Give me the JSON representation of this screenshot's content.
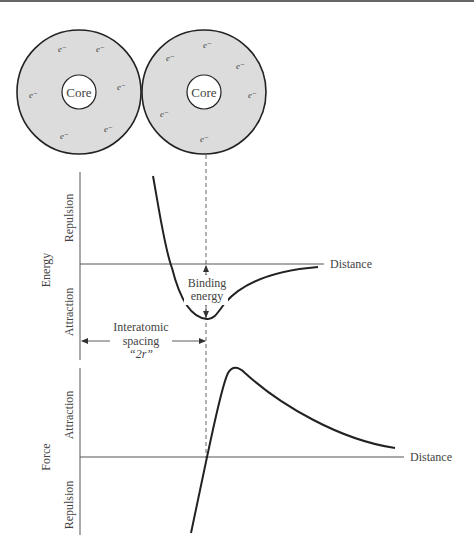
{
  "atoms": {
    "left": {
      "core_label": "Core",
      "electron_label": "e⁻"
    },
    "right": {
      "core_label": "Core",
      "electron_label": "e⁻"
    }
  },
  "energy_plot": {
    "ylabel": "Energy",
    "upper_label": "Repulsion",
    "lower_label": "Attraction",
    "xlabel": "Distance",
    "binding_label_1": "Binding",
    "binding_label_2": "energy",
    "spacing_label_1": "Interatomic",
    "spacing_label_2": "spacing",
    "spacing_label_3": "“2r”"
  },
  "force_plot": {
    "ylabel": "Force",
    "upper_label": "Attraction",
    "lower_label": "Repulsion",
    "xlabel": "Distance"
  },
  "colors": {
    "shell": "#dcdcdc",
    "line": "#222222",
    "axis": "#555555"
  }
}
